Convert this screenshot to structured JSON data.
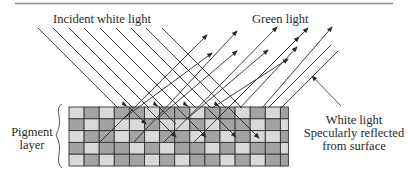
{
  "figure": {
    "labels": {
      "incident": "Incident white light",
      "green": "Green light",
      "specular_line1": "White light",
      "specular_line2": "Specularly reflected",
      "specular_line3": "from surface",
      "pigment_line1": "Pigment",
      "pigment_line2": "layer"
    },
    "colors": {
      "line": "#2b2b2b",
      "rule": "#888888",
      "cell_light": "#d9d9d9",
      "cell_dark": "#a3a3a3",
      "grid_line": "#333333"
    },
    "pigment_grid": {
      "x": 69,
      "y": 107,
      "cols": 15,
      "rows": 5,
      "col_width": 15.1,
      "row_height": 11.8,
      "pattern": [
        [
          0,
          1,
          0,
          1,
          1,
          0,
          1,
          1,
          0,
          1,
          1,
          0,
          1,
          0,
          1
        ],
        [
          1,
          0,
          1,
          0,
          0,
          1,
          0,
          0,
          1,
          0,
          1,
          1,
          0,
          1,
          0
        ],
        [
          0,
          1,
          1,
          0,
          1,
          0,
          1,
          1,
          0,
          1,
          0,
          1,
          0,
          0,
          1
        ],
        [
          1,
          0,
          1,
          1,
          0,
          1,
          0,
          1,
          1,
          0,
          1,
          0,
          1,
          1,
          0
        ],
        [
          0,
          1,
          0,
          1,
          1,
          0,
          1,
          0,
          1,
          1,
          0,
          1,
          0,
          1,
          1
        ]
      ]
    },
    "incident_rays": [
      {
        "x1": 38,
        "y1": 28,
        "x2": 118,
        "y2": 108
      },
      {
        "x1": 53,
        "y1": 28,
        "x2": 133,
        "y2": 108
      },
      {
        "x1": 69,
        "y1": 28,
        "x2": 149,
        "y2": 108
      },
      {
        "x1": 84,
        "y1": 28,
        "x2": 164,
        "y2": 108
      },
      {
        "x1": 100,
        "y1": 28,
        "x2": 180,
        "y2": 108
      },
      {
        "x1": 116,
        "y1": 28,
        "x2": 196,
        "y2": 108
      },
      {
        "x1": 131,
        "y1": 28,
        "x2": 211,
        "y2": 108
      },
      {
        "x1": 146,
        "y1": 28,
        "x2": 226,
        "y2": 108
      },
      {
        "x1": 162,
        "y1": 28,
        "x2": 242,
        "y2": 108
      }
    ],
    "deep_rays": [
      {
        "x1": 130,
        "y1": 108,
        "x2": 146,
        "y2": 124,
        "arrow": true
      },
      {
        "x1": 160,
        "y1": 108,
        "x2": 176,
        "y2": 124,
        "arrow": false
      },
      {
        "x1": 147,
        "y1": 108,
        "x2": 176,
        "y2": 137,
        "arrow": true
      },
      {
        "x1": 177,
        "y1": 108,
        "x2": 206,
        "y2": 137,
        "arrow": true
      },
      {
        "x1": 207,
        "y1": 108,
        "x2": 236,
        "y2": 137,
        "arrow": true
      },
      {
        "x1": 229,
        "y1": 108,
        "x2": 259,
        "y2": 138,
        "arrow": true
      }
    ],
    "surface_arrow_heads": [
      {
        "x": 127,
        "y": 106
      },
      {
        "x": 158,
        "y": 106
      },
      {
        "x": 188,
        "y": 106
      },
      {
        "x": 219,
        "y": 106
      }
    ],
    "green_rays": [
      {
        "x1": 100,
        "y1": 142,
        "x2": 207,
        "y2": 35
      },
      {
        "x1": 134,
        "y1": 142,
        "x2": 237,
        "y2": 31
      },
      {
        "x1": 164,
        "y1": 142,
        "x2": 277,
        "y2": 27
      },
      {
        "x1": 194,
        "y1": 142,
        "x2": 308,
        "y2": 28
      },
      {
        "x1": 124,
        "y1": 118,
        "x2": 212,
        "y2": 53
      },
      {
        "x1": 158,
        "y1": 118,
        "x2": 237,
        "y2": 51
      },
      {
        "x1": 188,
        "y1": 118,
        "x2": 268,
        "y2": 50
      },
      {
        "x1": 218,
        "y1": 118,
        "x2": 299,
        "y2": 37
      },
      {
        "x1": 212,
        "y1": 108,
        "x2": 288,
        "y2": 59
      },
      {
        "x1": 240,
        "y1": 108,
        "x2": 297,
        "y2": 47
      },
      {
        "x1": 262,
        "y1": 108,
        "x2": 332,
        "y2": 27
      }
    ],
    "specular_rays": [
      {
        "x1": 268,
        "y1": 108,
        "x2": 331,
        "y2": 45
      },
      {
        "x1": 281,
        "y1": 108,
        "x2": 338,
        "y2": 51
      }
    ],
    "callout": {
      "x1": 341,
      "y1": 106,
      "x2": 312,
      "y2": 76
    }
  }
}
